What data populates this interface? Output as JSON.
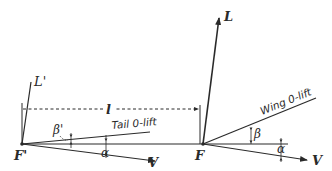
{
  "diagram": {
    "type": "vector-force-diagram",
    "labels": {
      "wing_lift": "L",
      "tail_lift": "L'",
      "distance": "l",
      "tail_zero_lift": "Tail 0-lift",
      "wing_zero_lift": "Wing 0-lift",
      "wing_point": "F",
      "tail_point": "F'",
      "velocity_wing": "V",
      "velocity_tail": "V",
      "wing_angle": "β",
      "tail_angle": "β'",
      "alpha_wing": "α",
      "alpha_tail": "α"
    },
    "colors": {
      "ink": "#2a2a2a",
      "background": "#ffffff"
    }
  }
}
